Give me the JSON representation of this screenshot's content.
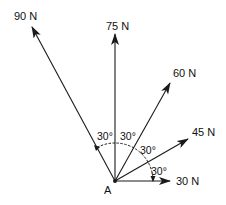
{
  "diagram": {
    "type": "force-vector-diagram",
    "origin": {
      "label": "A"
    },
    "forces": [
      {
        "label": "30 N",
        "magnitude": 30,
        "unit": "N",
        "direction_deg": 0
      },
      {
        "label": "45 N",
        "magnitude": 45,
        "unit": "N",
        "direction_deg": 30
      },
      {
        "label": "60 N",
        "magnitude": 60,
        "unit": "N",
        "direction_deg": 60
      },
      {
        "label": "75 N",
        "magnitude": 75,
        "unit": "N",
        "direction_deg": 90
      },
      {
        "label": "90 N",
        "magnitude": 90,
        "unit": "N",
        "direction_deg": 120
      }
    ],
    "angles": [
      {
        "label": "30°",
        "between": [
          "30 N",
          "45 N"
        ]
      },
      {
        "label": "30°",
        "between": [
          "45 N",
          "60 N"
        ]
      },
      {
        "label": "30°",
        "between": [
          "60 N",
          "75 N"
        ]
      },
      {
        "label": "30°",
        "between": [
          "75 N",
          "90 N"
        ]
      }
    ],
    "line_color": "#1a1a1a"
  }
}
